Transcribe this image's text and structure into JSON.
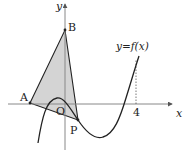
{
  "diagram": {
    "type": "function-graph-with-triangle",
    "axes": {
      "x_label": "x",
      "y_label": "y",
      "origin_label": "O"
    },
    "curve": {
      "label": "y=f(x)",
      "description": "cubic-like curve with local max near origin and local min between P and x=4"
    },
    "points": {
      "A": {
        "label": "A",
        "location": "on negative x-axis"
      },
      "B": {
        "label": "B",
        "location": "on positive y-axis"
      },
      "P": {
        "label": "P",
        "location": "on curve, below x-axis, right of origin"
      },
      "O": {
        "label": "O",
        "location": "origin"
      }
    },
    "triangle": {
      "vertices": [
        "A",
        "B",
        "P"
      ],
      "fill": "#d4d4d4",
      "stroke": "#222222"
    },
    "tick_marks": [
      {
        "axis": "x",
        "value": "4",
        "dashed_guide": true
      }
    ],
    "colors": {
      "axis": "#888888",
      "curve": "#222222",
      "triangle_fill": "#d4d4d4",
      "dashed_guide": "#555555"
    }
  }
}
